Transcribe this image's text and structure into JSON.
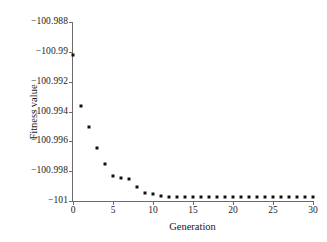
{
  "chart_data": {
    "type": "scatter",
    "title": "",
    "xlabel": "Generation",
    "ylabel": "Fitness value",
    "xlim": [
      0,
      30
    ],
    "ylim": [
      -101,
      -100.988
    ],
    "xticks": [
      0,
      5,
      10,
      15,
      20,
      25,
      30
    ],
    "xtick_labels": [
      "0",
      "5",
      "10",
      "15",
      "20",
      "25",
      "30"
    ],
    "yticks": [
      -100.988,
      -100.99,
      -100.992,
      -100.994,
      -100.996,
      -100.998,
      -101
    ],
    "ytick_labels": [
      "−100.988",
      "−100.99",
      "−100.992",
      "−100.994",
      "−100.996",
      "−100.998",
      "−101"
    ],
    "grid": false,
    "legend": null,
    "marker": "square",
    "marker_color": "#111111",
    "x": [
      0,
      1,
      2,
      3,
      4,
      5,
      6,
      7,
      8,
      9,
      10,
      11,
      12,
      13,
      14,
      15,
      16,
      17,
      18,
      19,
      20,
      21,
      22,
      23,
      24,
      25,
      26,
      27,
      28,
      29,
      30
    ],
    "values": [
      -100.9902,
      -100.99365,
      -100.99505,
      -100.99645,
      -100.99755,
      -100.99835,
      -100.99845,
      -100.99855,
      -100.99905,
      -100.99945,
      -100.99955,
      -100.99965,
      -100.9997,
      -100.9997,
      -100.9997,
      -100.9997,
      -100.9997,
      -100.9997,
      -100.9997,
      -100.9997,
      -100.9997,
      -100.9997,
      -100.9997,
      -100.9997,
      -100.9997,
      -100.9997,
      -100.9997,
      -100.9997,
      -100.9997,
      -100.9997,
      -100.9997
    ],
    "series": [
      {
        "name": "Fitness value",
        "values": [
          -100.9902,
          -100.99365,
          -100.99505,
          -100.99645,
          -100.99755,
          -100.99835,
          -100.99845,
          -100.99855,
          -100.99905,
          -100.99945,
          -100.99955,
          -100.99965,
          -100.9997,
          -100.9997,
          -100.9997,
          -100.9997,
          -100.9997,
          -100.9997,
          -100.9997,
          -100.9997,
          -100.9997,
          -100.9997,
          -100.9997,
          -100.9997,
          -100.9997,
          -100.9997,
          -100.9997,
          -100.9997,
          -100.9997,
          -100.9997,
          -100.9997
        ]
      }
    ]
  }
}
